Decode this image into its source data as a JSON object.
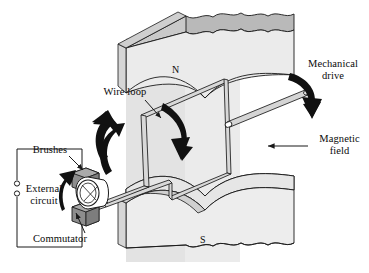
{
  "figure": {
    "background_color": "#ffffff",
    "ink_color": "#0a0a0a"
  },
  "palette": {
    "magnet_top_face": "#b9b9b9",
    "magnet_front_face": "#e9e9e9",
    "magnet_side_face": "#d6d6d6",
    "field_band": "#e3e3e3",
    "brush_fill": "#8a8a8a",
    "brush_top": "#a8a8a8",
    "commutator_fill": "#ffffff",
    "wire_fill": "#d8d8d8",
    "arrow_black": "#111111",
    "outline": "#1a1a1a"
  },
  "labels": {
    "wire_loop": "Wire loop",
    "mechanical_drive": "Mechanical\ndrive",
    "magnetic_field": "Magnetic\nfield",
    "brushes": "Brushes",
    "external_circuit": "External\ncircuit",
    "commutator": "Commutator",
    "pole_north": "N",
    "pole_south": "S"
  },
  "components": {
    "magnet_north": {
      "name": "north-pole-magnet-block",
      "pole": "N",
      "position": "top"
    },
    "magnet_south": {
      "name": "south-pole-magnet-block",
      "pole": "S",
      "position": "bottom"
    },
    "field_band": {
      "name": "magnetic-field-region",
      "orientation": "vertical"
    },
    "wire_loop": {
      "name": "rotating-wire-loop"
    },
    "drive_shaft": {
      "name": "drive-shaft",
      "direction": "upper-right"
    },
    "commutator": {
      "name": "split-ring-commutator",
      "segments": 2
    },
    "brushes": {
      "name": "carbon-brushes",
      "count": 2
    },
    "external_circuit": {
      "name": "external-circuit-loop",
      "terminals": 2
    }
  },
  "arrows": {
    "rotation_left": {
      "name": "rotation-arrow-up",
      "direction": "up",
      "style": "thick-curved"
    },
    "rotation_right": {
      "name": "rotation-arrow-down",
      "direction": "down",
      "style": "thick-curved"
    },
    "mechanical_drive": {
      "name": "mechanical-drive-arrow",
      "direction": "down",
      "style": "thick-curved"
    },
    "commutator_rotation": {
      "name": "commutator-rotation-arrow",
      "direction": "up",
      "style": "thick-curved"
    },
    "magnetic_field": {
      "name": "magnetic-field-arrow",
      "direction": "left",
      "style": "thin-straight"
    },
    "leader_wire_loop": {
      "name": "wire-loop-leader-arrow"
    },
    "leader_brushes": {
      "name": "brushes-leader-arrow"
    },
    "leader_commutator": {
      "name": "commutator-leader-arrow"
    }
  }
}
